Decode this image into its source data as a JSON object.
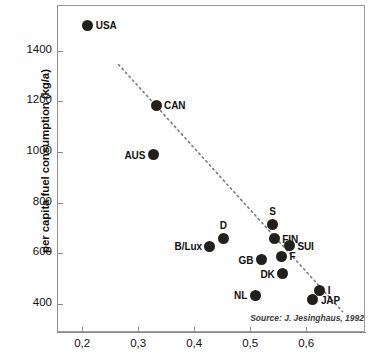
{
  "chart_data": {
    "type": "scatter",
    "title": "",
    "xlabel": "",
    "ylabel": "per capita fuel consumption (kg/a)",
    "xlim": [
      0.155,
      0.705
    ],
    "ylim": [
      290,
      1580
    ],
    "grid": false,
    "legend": null,
    "source": "Source: J. Jesinghaus, 1992",
    "x_ticks": [
      "0,2",
      "0,3",
      "0,4",
      "0,5",
      "0,6"
    ],
    "x_tick_values": [
      0.2,
      0.3,
      0.4,
      0.5,
      0.6
    ],
    "y_ticks": [
      "1400",
      "1200",
      "1000",
      "800",
      "600",
      "400"
    ],
    "y_tick_values": [
      1400,
      1200,
      1000,
      800,
      600,
      400
    ],
    "point_color": "#231f1c",
    "trend_line": {
      "style": "dotted",
      "color": "#7a7a7a",
      "x_start": 0.265,
      "y_start": 1345,
      "x_end": 0.665,
      "y_end": 370
    },
    "points": [
      {
        "label": "USA",
        "x": 0.21,
        "y": 1500,
        "label_pos": "right"
      },
      {
        "label": "CAN",
        "x": 0.332,
        "y": 1185,
        "label_pos": "right"
      },
      {
        "label": "AUS",
        "x": 0.327,
        "y": 990,
        "label_pos": "left"
      },
      {
        "label": "S",
        "x": 0.54,
        "y": 715,
        "label_pos": "above"
      },
      {
        "label": "FIN",
        "x": 0.543,
        "y": 658,
        "label_pos": "right"
      },
      {
        "label": "D",
        "x": 0.452,
        "y": 660,
        "label_pos": "above"
      },
      {
        "label": "SUI",
        "x": 0.57,
        "y": 630,
        "label_pos": "right"
      },
      {
        "label": "B/Lux",
        "x": 0.428,
        "y": 628,
        "label_pos": "left"
      },
      {
        "label": "GB",
        "x": 0.52,
        "y": 575,
        "label_pos": "left"
      },
      {
        "label": "F",
        "x": 0.556,
        "y": 588,
        "label_pos": "right"
      },
      {
        "label": "DK",
        "x": 0.558,
        "y": 520,
        "label_pos": "left"
      },
      {
        "label": "I",
        "x": 0.624,
        "y": 455,
        "label_pos": "right"
      },
      {
        "label": "JAP",
        "x": 0.612,
        "y": 418,
        "label_pos": "right"
      },
      {
        "label": "NL",
        "x": 0.509,
        "y": 435,
        "label_pos": "left"
      }
    ]
  }
}
